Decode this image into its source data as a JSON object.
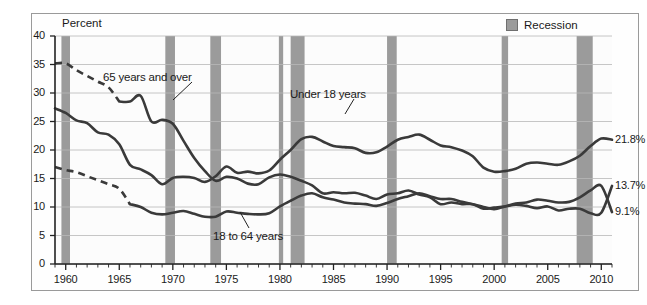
{
  "legend": {
    "items": [
      {
        "label": "Recession",
        "swatch_color": "#9b9b9b",
        "icon": "recession-swatch"
      }
    ]
  },
  "axis_title": "Percent",
  "annotations": [
    {
      "id": "over65",
      "label": "65 years and over"
    },
    {
      "id": "under18",
      "label": "Under 18 years"
    },
    {
      "id": "adults",
      "label": "18 to 64 years"
    }
  ],
  "end_labels": [
    {
      "id": "under18",
      "label": "21.8%"
    },
    {
      "id": "over65b",
      "label": "13.7%"
    },
    {
      "id": "adults",
      "label": "9.1%"
    }
  ],
  "chart_data": {
    "type": "line",
    "title": "",
    "xlabel": "",
    "ylabel": "Percent",
    "xlim": [
      1959,
      2011
    ],
    "ylim": [
      0,
      40
    ],
    "ytick_step": 5,
    "yticks": [
      "0",
      "5",
      "10",
      "15",
      "20",
      "25",
      "30",
      "35",
      "40"
    ],
    "xticks": [
      "1960",
      "1965",
      "1970",
      "1975",
      "1980",
      "1985",
      "1990",
      "1995",
      "2000",
      "2005",
      "2010"
    ],
    "xtick_values": [
      1960,
      1965,
      1970,
      1975,
      1980,
      1985,
      1990,
      1995,
      2000,
      2005,
      2010
    ],
    "minor_xticks": "every year",
    "grid": "horizontal",
    "legend_position": "top-right",
    "line_color": "#3a3a3a",
    "recession_color": "#9b9b9b",
    "series": [
      {
        "name": "65 years and over",
        "end_value": 13.7,
        "dashed_range": [
          1959,
          1965
        ],
        "x": [
          1959,
          1960,
          1961,
          1962,
          1963,
          1964,
          1965,
          1966,
          1967,
          1968,
          1969,
          1970,
          1971,
          1972,
          1973,
          1974,
          1975,
          1976,
          1977,
          1978,
          1979,
          1980,
          1981,
          1982,
          1983,
          1984,
          1985,
          1986,
          1987,
          1988,
          1989,
          1990,
          1991,
          1992,
          1993,
          1994,
          1995,
          1996,
          1997,
          1998,
          1999,
          2000,
          2001,
          2002,
          2003,
          2004,
          2005,
          2006,
          2007,
          2008,
          2009,
          2010,
          2011
        ],
        "values": [
          35.2,
          35.2,
          34.0,
          33.0,
          32.0,
          31.0,
          28.5,
          28.5,
          29.5,
          25.0,
          25.3,
          24.6,
          21.6,
          18.6,
          16.3,
          14.6,
          15.3,
          15.0,
          14.1,
          14.0,
          15.2,
          15.7,
          15.3,
          14.6,
          13.8,
          12.4,
          12.6,
          12.4,
          12.5,
          12.0,
          11.4,
          12.2,
          12.4,
          12.9,
          12.2,
          11.7,
          10.5,
          10.8,
          10.5,
          10.5,
          9.7,
          9.9,
          10.1,
          10.4,
          10.2,
          9.8,
          10.1,
          9.4,
          9.7,
          9.7,
          8.9,
          9.0,
          13.7
        ]
      },
      {
        "name": "Under 18 years",
        "end_value": 21.8,
        "dashed_range": null,
        "x": [
          1959,
          1960,
          1961,
          1962,
          1963,
          1964,
          1965,
          1966,
          1967,
          1968,
          1969,
          1970,
          1971,
          1972,
          1973,
          1974,
          1975,
          1976,
          1977,
          1978,
          1979,
          1980,
          1981,
          1982,
          1983,
          1984,
          1985,
          1986,
          1987,
          1988,
          1989,
          1990,
          1991,
          1992,
          1993,
          1994,
          1995,
          1996,
          1997,
          1998,
          1999,
          2000,
          2001,
          2002,
          2003,
          2004,
          2005,
          2006,
          2007,
          2008,
          2009,
          2010,
          2011
        ],
        "values": [
          27.3,
          26.5,
          25.2,
          24.7,
          23.1,
          22.7,
          21.0,
          17.4,
          16.6,
          15.6,
          14.0,
          15.1,
          15.3,
          15.1,
          14.4,
          15.4,
          17.1,
          16.0,
          16.2,
          15.9,
          16.4,
          18.3,
          20.0,
          21.9,
          22.3,
          21.5,
          20.7,
          20.5,
          20.3,
          19.5,
          19.6,
          20.6,
          21.8,
          22.3,
          22.7,
          21.8,
          20.8,
          20.5,
          19.9,
          18.9,
          16.9,
          16.2,
          16.3,
          16.7,
          17.6,
          17.8,
          17.6,
          17.4,
          18.0,
          19.0,
          20.7,
          22.0,
          21.8
        ]
      },
      {
        "name": "18 to 64 years",
        "end_value": 9.1,
        "dashed_range": [
          1959,
          1966
        ],
        "x": [
          1959,
          1960,
          1961,
          1962,
          1963,
          1964,
          1965,
          1966,
          1967,
          1968,
          1969,
          1970,
          1971,
          1972,
          1973,
          1974,
          1975,
          1976,
          1977,
          1978,
          1979,
          1980,
          1981,
          1982,
          1983,
          1984,
          1985,
          1986,
          1987,
          1988,
          1989,
          1990,
          1991,
          1992,
          1993,
          1994,
          1995,
          1996,
          1997,
          1998,
          1999,
          2000,
          2001,
          2002,
          2003,
          2004,
          2005,
          2006,
          2007,
          2008,
          2009,
          2010,
          2011
        ],
        "values": [
          17.0,
          16.5,
          16.1,
          15.4,
          14.7,
          14.0,
          13.2,
          10.5,
          10.0,
          9.0,
          8.7,
          9.0,
          9.3,
          8.8,
          8.3,
          8.3,
          9.2,
          9.0,
          8.8,
          8.7,
          8.9,
          10.1,
          11.1,
          12.0,
          12.4,
          11.7,
          11.3,
          10.8,
          10.6,
          10.5,
          10.2,
          10.7,
          11.4,
          11.9,
          12.4,
          11.9,
          11.4,
          11.4,
          10.9,
          10.5,
          10.0,
          9.6,
          10.1,
          10.6,
          10.8,
          11.3,
          11.1,
          10.8,
          10.9,
          11.7,
          12.9,
          13.7,
          9.1
        ]
      }
    ],
    "recessions": [
      {
        "start": 1959.6,
        "end": 1960.4
      },
      {
        "start": 1969.3,
        "end": 1970.2
      },
      {
        "start": 1973.5,
        "end": 1974.5
      },
      {
        "start": 1979.9,
        "end": 1980.3
      },
      {
        "start": 1981.0,
        "end": 1982.3
      },
      {
        "start": 1990.0,
        "end": 1990.9
      },
      {
        "start": 2000.7,
        "end": 2001.3
      },
      {
        "start": 2007.7,
        "end": 2009.2
      }
    ]
  }
}
